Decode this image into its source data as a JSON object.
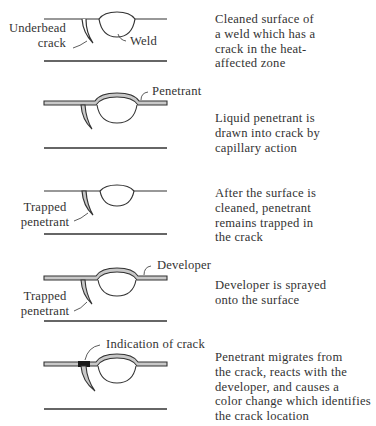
{
  "colors": {
    "ink": "#333333",
    "penetrant_fill": "#c8c8c8",
    "indication": "#1a1a1a",
    "background": "#ffffff"
  },
  "steps": [
    {
      "step": 1,
      "labels": {
        "crack": "Underbead\ncrack",
        "weld": "Weld"
      },
      "description": "Cleaned surface of\na weld which has a\ncrack in the heat-\naffected zone"
    },
    {
      "step": 2,
      "labels": {
        "penetrant": "Penetrant"
      },
      "description": "Liquid penetrant is\ndrawn into crack by\ncapillary action"
    },
    {
      "step": 3,
      "labels": {
        "trapped": "Trapped\npenetrant"
      },
      "description": "After the surface is\ncleaned, penetrant\nremains trapped in\nthe crack"
    },
    {
      "step": 4,
      "labels": {
        "developer": "Developer",
        "trapped": "Trapped\npenetrant"
      },
      "description": "Developer is sprayed\nonto the surface"
    },
    {
      "step": 5,
      "labels": {
        "indication": "Indication of crack"
      },
      "description": "Penetrant migrates from\nthe crack, reacts with the\ndeveloper, and causes a\ncolor change which identifies\nthe crack location"
    }
  ]
}
